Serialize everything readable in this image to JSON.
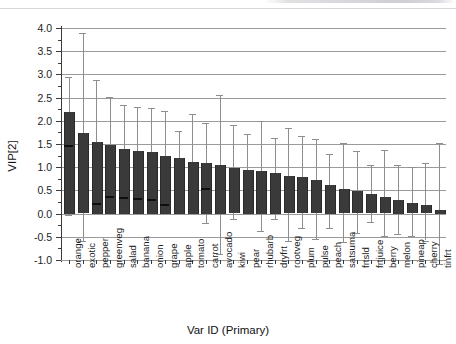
{
  "chart_data": {
    "type": "bar",
    "title": "",
    "xlabel": "Var ID (Primary)",
    "ylabel": "VIP[2]",
    "ylim": [
      -1.0,
      4.0
    ],
    "yticks": [
      -1.0,
      -0.5,
      0.0,
      0.5,
      1.0,
      1.5,
      2.0,
      2.5,
      3.0,
      3.5,
      4.0
    ],
    "ytick_labels": [
      "-1.0",
      "-0.5",
      "0.0",
      "0.5",
      "1.0",
      "1.5",
      "2.0",
      "2.5",
      "3.0",
      "3.5",
      "4.0"
    ],
    "grid": true,
    "legend": "none",
    "orientation": "vertical",
    "error_bars": true,
    "categories": [
      "orange",
      "exotic",
      "pepper",
      "greenveg",
      "salad",
      "banana",
      "onion",
      "grape",
      "apple",
      "tomato",
      "carrot",
      "avocado",
      "kiwi",
      "pear",
      "rhubarb",
      "dryfrt",
      "rootveg",
      "plum",
      "pulse",
      "peach",
      "satsuma",
      "frtsld",
      "frtjuice",
      "berry",
      "melon",
      "pineap",
      "cherry",
      "tinfrt"
    ],
    "values": [
      2.2,
      1.73,
      1.55,
      1.48,
      1.4,
      1.35,
      1.33,
      1.25,
      1.2,
      1.12,
      1.1,
      1.05,
      0.98,
      0.95,
      0.92,
      0.88,
      0.8,
      0.78,
      0.72,
      0.62,
      0.52,
      0.48,
      0.42,
      0.35,
      0.3,
      0.22,
      0.18,
      0.08
    ],
    "error_upper": [
      2.95,
      3.9,
      2.88,
      2.52,
      2.35,
      2.3,
      2.28,
      2.22,
      1.78,
      2.15,
      1.95,
      2.55,
      1.9,
      1.72,
      2.0,
      1.62,
      1.85,
      1.68,
      1.6,
      1.28,
      1.52,
      1.35,
      1.05,
      1.38,
      1.05,
      1.0,
      1.1,
      1.52
    ],
    "error_lower": [
      -0.02,
      -0.6,
      0.18,
      0.3,
      0.28,
      0.25,
      0.23,
      0.15,
      0.35,
      0.1,
      -0.2,
      -0.88,
      -0.12,
      0.0,
      -0.38,
      -0.12,
      -0.6,
      -0.3,
      -0.55,
      -0.3,
      -0.62,
      -0.42,
      -0.18,
      -0.48,
      -0.45,
      -0.48,
      -0.58,
      -1.08
    ],
    "inner_markers": [
      1.47,
      null,
      0.22,
      0.38,
      0.35,
      0.33,
      0.32,
      0.2,
      null,
      null,
      0.55,
      null,
      null,
      null,
      null,
      null,
      null,
      null,
      null,
      null,
      null,
      null,
      null,
      null,
      null,
      null,
      null,
      null
    ]
  },
  "colors": {
    "bar": "#3a3a3a",
    "whisker": "#8e8e8e",
    "grid": "#9a9a9a",
    "axis": "#3a3a3a",
    "text": "#1d1d1d",
    "background": "#ffffff"
  }
}
